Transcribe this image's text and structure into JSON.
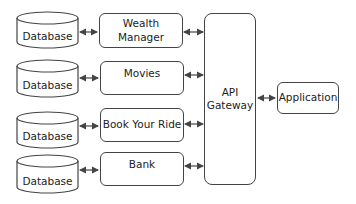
{
  "diagram": {
    "databases": [
      {
        "label": "Database"
      },
      {
        "label": "Database"
      },
      {
        "label": "Database"
      },
      {
        "label": "Database"
      }
    ],
    "services": [
      {
        "label": "Wealth Manager"
      },
      {
        "label": "Movies"
      },
      {
        "label": "Book Your Ride"
      },
      {
        "label": "Bank"
      }
    ],
    "gateway": {
      "label_line1": "API",
      "label_line2": "Gateway"
    },
    "client": {
      "label": "Application"
    },
    "colors": {
      "stroke": "#444444",
      "background": "#ffffff",
      "text": "#222222"
    }
  }
}
